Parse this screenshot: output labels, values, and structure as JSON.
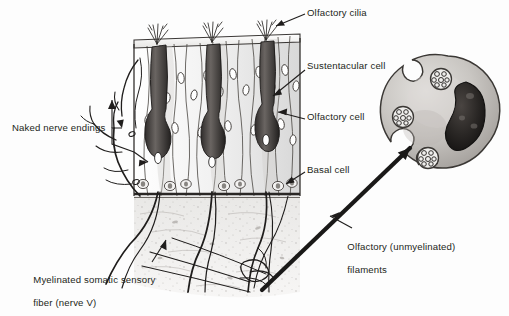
{
  "figure": {
    "style": "grayscale pencil/ink textbook illustration",
    "background_color": "#fdfdfd",
    "ink_color": "#231f20"
  },
  "labels": {
    "olfactory_cilia": "Olfactory cilia",
    "sustentacular_cell": "Sustentacular cell",
    "olfactory_cell": "Olfactory cell",
    "basal_cell": "Basal cell",
    "naked_nerve_endings": "Naked nerve endings",
    "olfactory_filaments_line1": "Olfactory (unmyelinated)",
    "olfactory_filaments_line2": "filaments",
    "myelinated_fiber_line1": "Myelinated somatic sensory",
    "myelinated_fiber_line2": "fiber (nerve V)"
  },
  "structures": {
    "epithelium_block": {
      "name": "olfactory epithelium cutaway block",
      "olfactory_cell_count": 3,
      "cilia_tuft_count": 3,
      "sustentacular_column_count": 12,
      "basal_cell_row": true,
      "basement_membrane": true
    },
    "lamina_propria": {
      "name": "lamina propria with converging nerve fibers",
      "fiber_bundle_count": 4
    },
    "schwann_cell_inset": {
      "name": "Schwann cell cross-section",
      "nucleus": "kidney-shaped dark nucleus",
      "axon_cluster_count": 3,
      "axons_per_cluster": 7
    }
  }
}
